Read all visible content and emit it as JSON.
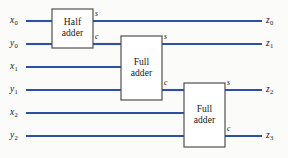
{
  "figure": {
    "kind": "logic-circuit-diagram",
    "canvas": {
      "width": 288,
      "height": 158
    },
    "colors": {
      "wire": "#2b50a6",
      "box_outline": "#4a4a4a",
      "box_fill": "#ffffff",
      "background": "#fbfbfa",
      "text": "#15151a"
    }
  },
  "inputs": [
    {
      "id": "x0",
      "base": "x",
      "sub": "0",
      "y": 21
    },
    {
      "id": "y0",
      "base": "y",
      "sub": "0",
      "y": 44
    },
    {
      "id": "x1",
      "base": "x",
      "sub": "1",
      "y": 67
    },
    {
      "id": "y1",
      "base": "y",
      "sub": "1",
      "y": 90
    },
    {
      "id": "x2",
      "base": "x",
      "sub": "2",
      "y": 113
    },
    {
      "id": "y2",
      "base": "y",
      "sub": "2",
      "y": 136
    }
  ],
  "outputs": [
    {
      "id": "z0",
      "base": "z",
      "sub": "0",
      "y": 21
    },
    {
      "id": "z1",
      "base": "z",
      "sub": "1",
      "y": 44
    },
    {
      "id": "z2",
      "base": "z",
      "sub": "2",
      "y": 90
    },
    {
      "id": "z3",
      "base": "z",
      "sub": "3",
      "y": 136
    }
  ],
  "blocks": [
    {
      "id": "half-adder",
      "line1": "Half",
      "line2": "adder",
      "x": 52,
      "y": 9,
      "width": 41,
      "height": 39,
      "inputs": [
        {
          "name": "a",
          "y": 21
        },
        {
          "name": "b",
          "y": 44
        }
      ],
      "outputs": [
        {
          "name": "s",
          "label": "s",
          "y": 21
        },
        {
          "name": "c",
          "label": "c",
          "y": 44
        }
      ]
    },
    {
      "id": "full-adder-1",
      "line1": "Full",
      "line2": "adder",
      "x": 121,
      "y": 36,
      "width": 41,
      "height": 64,
      "inputs": [
        {
          "name": "cin",
          "y": 44
        },
        {
          "name": "a",
          "y": 67
        },
        {
          "name": "b",
          "y": 90
        }
      ],
      "outputs": [
        {
          "name": "s",
          "label": "s",
          "y": 44
        },
        {
          "name": "c",
          "label": "c",
          "y": 90
        }
      ]
    },
    {
      "id": "full-adder-2",
      "line1": "Full",
      "line2": "adder",
      "x": 184,
      "y": 83,
      "width": 41,
      "height": 64,
      "inputs": [
        {
          "name": "cin",
          "y": 90
        },
        {
          "name": "a",
          "y": 113
        },
        {
          "name": "b",
          "y": 136
        }
      ],
      "outputs": [
        {
          "name": "s",
          "label": "s",
          "y": 90
        },
        {
          "name": "c",
          "label": "c",
          "y": 136
        }
      ]
    }
  ],
  "pin_labels": [
    {
      "id": "ha-s",
      "text": "s",
      "x": 95,
      "y": 9
    },
    {
      "id": "ha-c",
      "text": "c",
      "x": 95,
      "y": 32
    },
    {
      "id": "fa1-s",
      "text": "s",
      "x": 164,
      "y": 32
    },
    {
      "id": "fa1-c",
      "text": "c",
      "x": 164,
      "y": 78
    },
    {
      "id": "fa2-s",
      "text": "s",
      "x": 227,
      "y": 78
    },
    {
      "id": "fa2-c",
      "text": "c",
      "x": 227,
      "y": 124
    }
  ],
  "wires": [
    {
      "id": "wire-x0-in",
      "from": "x0 label",
      "path": "M 26 21 L 52 21"
    },
    {
      "id": "wire-y0-in",
      "from": "y0 label",
      "path": "M 26 44 L 52 44"
    },
    {
      "id": "wire-ha-s-z0",
      "from": "half adder s",
      "path": "M 93 21 L 262 21"
    },
    {
      "id": "wire-ha-c-fa1",
      "from": "half adder c",
      "path": "M 93 44 L 121 44"
    },
    {
      "id": "wire-x1-in",
      "from": "x1 label",
      "path": "M 26 67 L 121 67"
    },
    {
      "id": "wire-y1-in",
      "from": "y1 label",
      "path": "M 26 90 L 121 90"
    },
    {
      "id": "wire-fa1-s-z1",
      "from": "full adder 1 s",
      "path": "M 162 44 L 262 44"
    },
    {
      "id": "wire-fa1-c-fa2",
      "from": "full adder 1 c",
      "path": "M 162 90 L 184 90"
    },
    {
      "id": "wire-x2-in",
      "from": "x2 label",
      "path": "M 26 113 L 184 113"
    },
    {
      "id": "wire-y2-in",
      "from": "y2 label",
      "path": "M 26 136 L 184 136"
    },
    {
      "id": "wire-fa2-s-z2",
      "from": "full adder 2 s",
      "path": "M 225 90 L 262 90"
    },
    {
      "id": "wire-fa2-c-z3",
      "from": "full adder 2 c",
      "path": "M 225 136 L 262 136"
    }
  ]
}
